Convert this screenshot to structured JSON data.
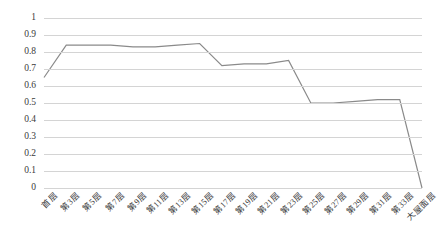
{
  "chart_data": {
    "type": "line",
    "title": "",
    "subtitle": "",
    "xlabel": "",
    "ylabel": "",
    "ylim": [
      0,
      1
    ],
    "y_ticks": [
      "0",
      "0.1",
      "0.2",
      "0.3",
      "0.4",
      "0.5",
      "0.6",
      "0.7",
      "0.8",
      "0.9",
      "1"
    ],
    "y_tick_values": [
      0,
      0.1,
      0.2,
      0.3,
      0.4,
      0.5,
      0.6,
      0.7,
      0.8,
      0.9,
      1
    ],
    "grid": true,
    "legend": "none",
    "categories": [
      "首层",
      "第3层",
      "第5层",
      "第7层",
      "第9层",
      "第11层",
      "第13层",
      "第15层",
      "第17层",
      "第19层",
      "第21层",
      "第23层",
      "第25层",
      "第27层",
      "第29层",
      "第31层",
      "第33层",
      "大屋面层"
    ],
    "values": [
      0.65,
      0.84,
      0.84,
      0.84,
      0.83,
      0.83,
      0.84,
      0.85,
      0.72,
      0.73,
      0.73,
      0.75,
      0.5,
      0.5,
      0.51,
      0.52,
      0.52,
      0.0
    ],
    "series": [
      {
        "name": "series-1",
        "color": "#8a8a8a",
        "values": [
          0.65,
          0.84,
          0.84,
          0.84,
          0.83,
          0.83,
          0.84,
          0.85,
          0.72,
          0.73,
          0.73,
          0.75,
          0.5,
          0.5,
          0.51,
          0.52,
          0.52,
          0.0
        ]
      }
    ]
  },
  "style": {
    "line_color": "#8a8a8a",
    "grid_color": "#d4d4d4",
    "text_color": "#3a3a3a",
    "background": "#ffffff"
  }
}
